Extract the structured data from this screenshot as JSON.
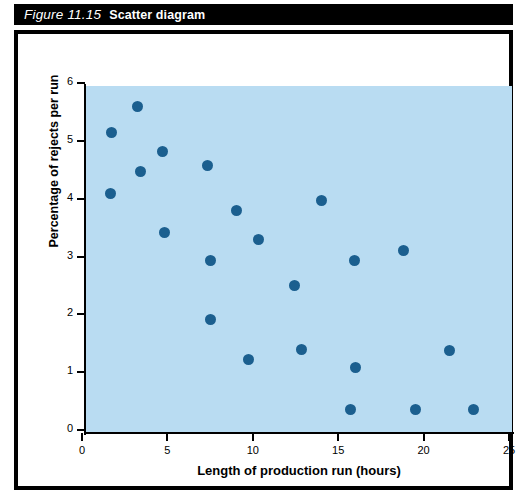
{
  "figure": {
    "number": "Figure 11.15",
    "caption": "Scatter diagram"
  },
  "colors": {
    "plot_background": "#b9dcf2",
    "point": "#1b5f8f",
    "axis": "#000000",
    "title_bar": "#000000",
    "panel_border": "#000000"
  },
  "chart_data": {
    "type": "scatter",
    "title": "Scatter diagram",
    "xlabel": "Length of production run (hours)",
    "ylabel": "Percentage of rejects per run",
    "xlim": [
      0,
      25
    ],
    "ylim": [
      0,
      6
    ],
    "xticks": [
      0,
      5,
      10,
      15,
      20,
      25
    ],
    "yticks": [
      0,
      1,
      2,
      3,
      4,
      5,
      6
    ],
    "grid": false,
    "legend": null,
    "x": [
      1.7,
      1.8,
      3.3,
      3.5,
      4.8,
      4.9,
      7.4,
      7.6,
      7.6,
      9.1,
      9.8,
      10.4,
      12.5,
      12.9,
      14.1,
      15.8,
      16.0,
      16.1,
      18.9,
      19.6,
      21.6,
      23.0
    ],
    "y": [
      4.07,
      5.12,
      5.57,
      4.45,
      4.8,
      3.4,
      4.55,
      2.92,
      1.9,
      3.78,
      1.2,
      3.28,
      2.48,
      1.38,
      3.95,
      0.34,
      2.92,
      1.06,
      3.08,
      0.33,
      1.35,
      0.33
    ],
    "points": [
      {
        "x": 1.7,
        "y": 4.07
      },
      {
        "x": 1.8,
        "y": 5.12
      },
      {
        "x": 3.3,
        "y": 5.57
      },
      {
        "x": 3.5,
        "y": 4.45
      },
      {
        "x": 4.8,
        "y": 4.8
      },
      {
        "x": 4.9,
        "y": 3.4
      },
      {
        "x": 7.4,
        "y": 4.55
      },
      {
        "x": 7.6,
        "y": 2.92
      },
      {
        "x": 7.6,
        "y": 1.9
      },
      {
        "x": 9.1,
        "y": 3.78
      },
      {
        "x": 9.8,
        "y": 1.2
      },
      {
        "x": 10.4,
        "y": 3.28
      },
      {
        "x": 12.5,
        "y": 2.48
      },
      {
        "x": 12.9,
        "y": 1.38
      },
      {
        "x": 14.1,
        "y": 3.95
      },
      {
        "x": 15.8,
        "y": 0.34
      },
      {
        "x": 16.0,
        "y": 2.92
      },
      {
        "x": 16.1,
        "y": 1.06
      },
      {
        "x": 18.9,
        "y": 3.08
      },
      {
        "x": 19.6,
        "y": 0.33
      },
      {
        "x": 21.6,
        "y": 1.35
      },
      {
        "x": 23.0,
        "y": 0.33
      }
    ]
  }
}
